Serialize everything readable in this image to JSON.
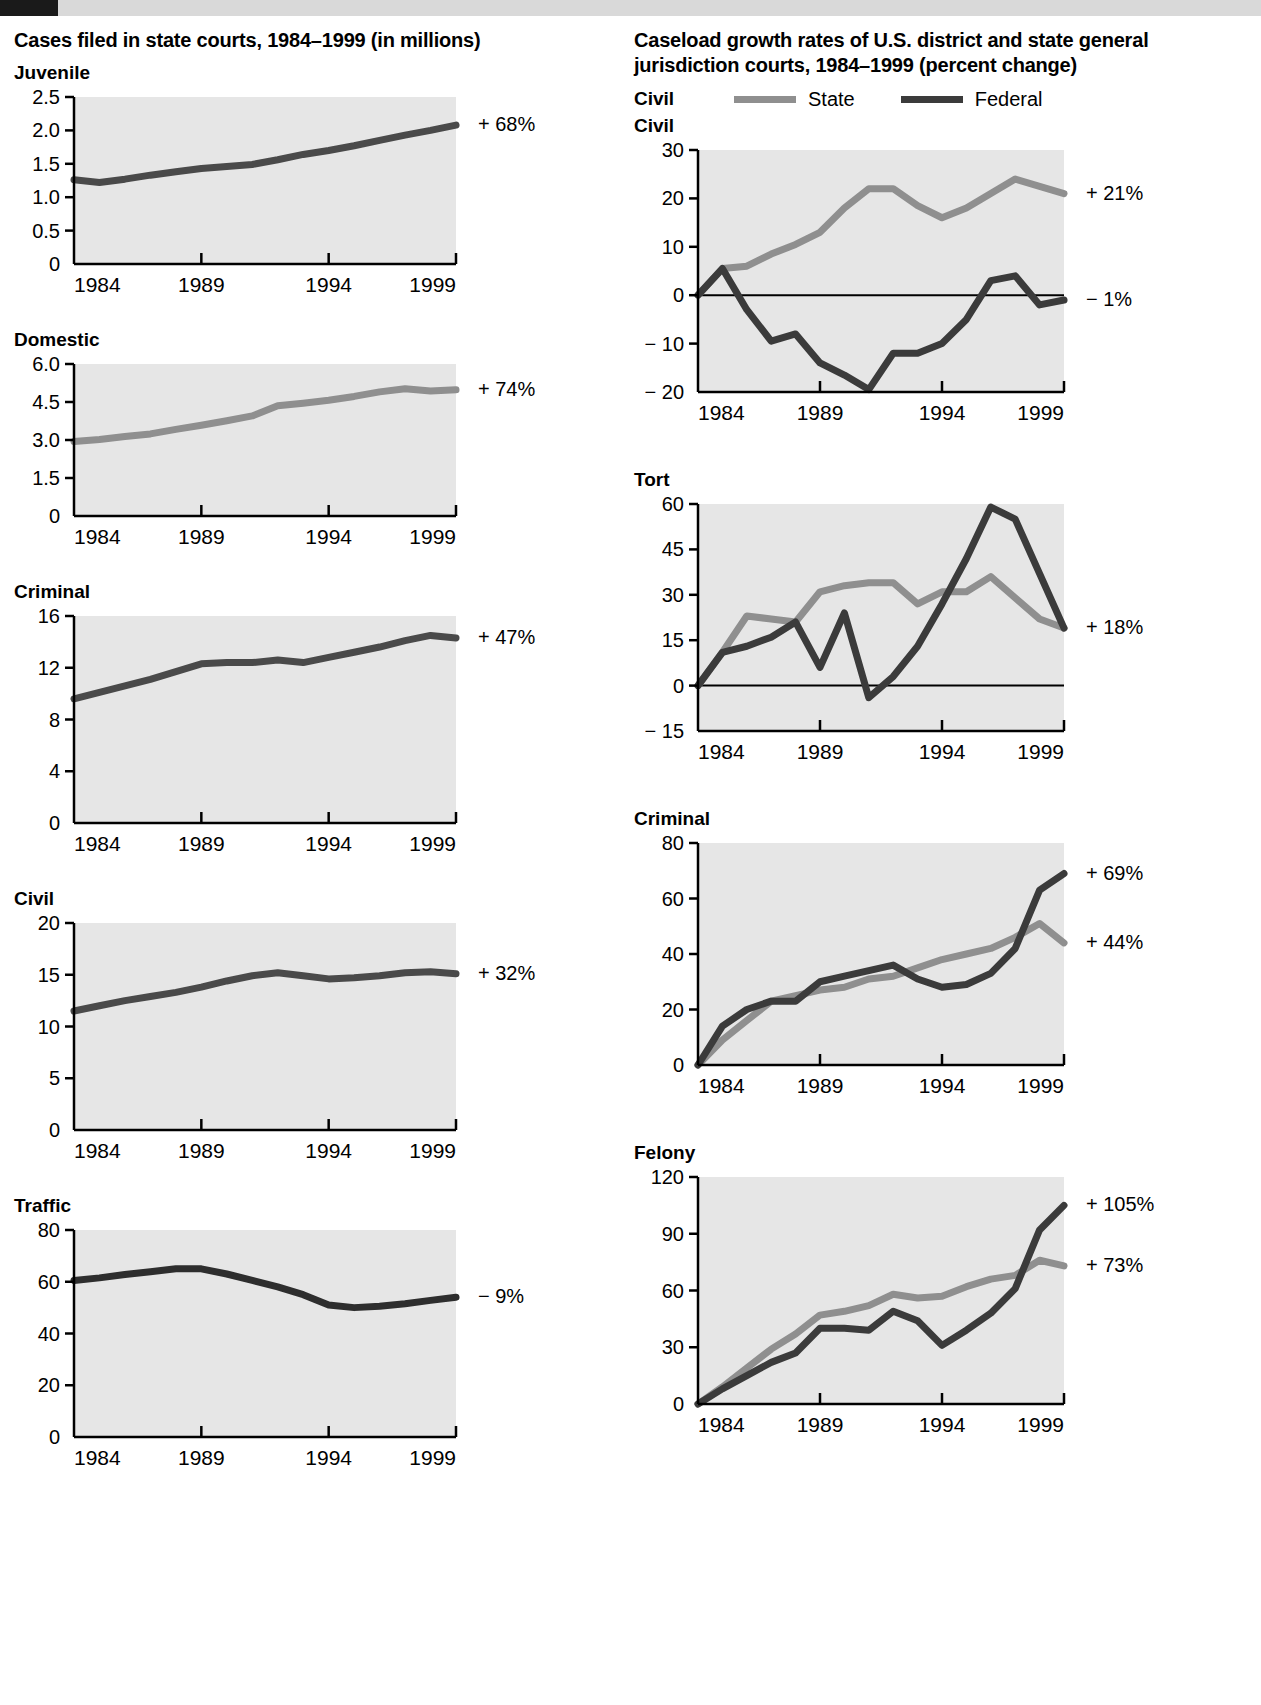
{
  "page": {
    "top_band_color": "#d9d9d9",
    "tab_color": "#1a1a1a"
  },
  "left_column": {
    "title": "Cases filed in state courts, 1984–1999 (in millions)"
  },
  "right_column": {
    "title": "Caseload growth rates of U.S. district and state general jurisdiction courts, 1984–1999 (percent change)",
    "legend": {
      "group_label": "Civil",
      "items": [
        {
          "label": "State",
          "color": "#8f8f8f"
        },
        {
          "label": "Federal",
          "color": "#3b3b3b"
        }
      ]
    }
  },
  "colors": {
    "state_line": "#8f8f8f",
    "federal_line": "#3b3b3b",
    "single_line": "#4a4a4a",
    "plot_bg": "#e6e6e6",
    "axis": "#000000"
  },
  "chart_data": [
    {
      "id": "left-juvenile",
      "type": "line",
      "title": "Juvenile",
      "xlabel": "",
      "ylabel": "",
      "xlim": [
        1984,
        1999
      ],
      "ylim": [
        0,
        2.5
      ],
      "yticks": [
        0,
        0.5,
        1.0,
        1.5,
        2.0,
        2.5
      ],
      "ytick_labels": [
        "0",
        "0.5",
        "1.0",
        "1.5",
        "2.0",
        "2.5"
      ],
      "xticks": [
        1984,
        1989,
        1994,
        1999
      ],
      "xtick_labels": [
        "1984",
        "1989",
        "1994",
        "1999"
      ],
      "grid": false,
      "annotation": "+ 68%",
      "x": [
        1984,
        1985,
        1986,
        1987,
        1988,
        1989,
        1990,
        1991,
        1992,
        1993,
        1994,
        1995,
        1996,
        1997,
        1998,
        1999
      ],
      "series": [
        {
          "name": "State",
          "color": "#4a4a4a",
          "values": [
            1.26,
            1.22,
            1.27,
            1.33,
            1.38,
            1.43,
            1.46,
            1.49,
            1.56,
            1.64,
            1.7,
            1.77,
            1.85,
            1.93,
            2.0,
            2.08
          ]
        }
      ]
    },
    {
      "id": "left-domestic",
      "type": "line",
      "title": "Domestic",
      "xlim": [
        1984,
        1999
      ],
      "ylim": [
        0,
        6.0
      ],
      "yticks": [
        0,
        1.5,
        3.0,
        4.5,
        6.0
      ],
      "ytick_labels": [
        "0",
        "1.5",
        "3.0",
        "4.5",
        "6.0"
      ],
      "xticks": [
        1984,
        1989,
        1994,
        1999
      ],
      "xtick_labels": [
        "1984",
        "1989",
        "1994",
        "1999"
      ],
      "grid": false,
      "annotation": "+ 74%",
      "x": [
        1984,
        1985,
        1986,
        1987,
        1988,
        1989,
        1990,
        1991,
        1992,
        1993,
        1994,
        1995,
        1996,
        1997,
        1998,
        1999
      ],
      "series": [
        {
          "name": "State",
          "color": "#8f8f8f",
          "values": [
            2.94,
            3.02,
            3.14,
            3.24,
            3.42,
            3.58,
            3.76,
            3.95,
            4.35,
            4.45,
            4.57,
            4.72,
            4.9,
            5.02,
            4.93,
            4.98
          ]
        }
      ]
    },
    {
      "id": "left-criminal",
      "type": "line",
      "title": "Criminal",
      "xlim": [
        1984,
        1999
      ],
      "ylim": [
        0,
        16
      ],
      "yticks": [
        0,
        4,
        8,
        12,
        16
      ],
      "ytick_labels": [
        "0",
        "4",
        "8",
        "12",
        "16"
      ],
      "xticks": [
        1984,
        1989,
        1994,
        1999
      ],
      "xtick_labels": [
        "1984",
        "1989",
        "1994",
        "1999"
      ],
      "grid": false,
      "annotation": "+ 47%",
      "x": [
        1984,
        1985,
        1986,
        1987,
        1988,
        1989,
        1990,
        1991,
        1992,
        1993,
        1994,
        1995,
        1996,
        1997,
        1998,
        1999
      ],
      "series": [
        {
          "name": "State",
          "color": "#4a4a4a",
          "values": [
            9.6,
            10.1,
            10.6,
            11.1,
            11.7,
            12.3,
            12.4,
            12.4,
            12.6,
            12.4,
            12.8,
            13.2,
            13.6,
            14.1,
            14.5,
            14.3
          ]
        }
      ]
    },
    {
      "id": "left-civil",
      "type": "line",
      "title": "Civil",
      "xlim": [
        1984,
        1999
      ],
      "ylim": [
        0,
        20
      ],
      "yticks": [
        0,
        5,
        10,
        15,
        20
      ],
      "ytick_labels": [
        "0",
        "5",
        "10",
        "15",
        "20"
      ],
      "xticks": [
        1984,
        1989,
        1994,
        1999
      ],
      "xtick_labels": [
        "1984",
        "1989",
        "1994",
        "1999"
      ],
      "grid": false,
      "annotation": "+ 32%",
      "x": [
        1984,
        1985,
        1986,
        1987,
        1988,
        1989,
        1990,
        1991,
        1992,
        1993,
        1994,
        1995,
        1996,
        1997,
        1998,
        1999
      ],
      "series": [
        {
          "name": "State",
          "color": "#4a4a4a",
          "values": [
            11.5,
            12.0,
            12.5,
            12.9,
            13.3,
            13.8,
            14.4,
            14.9,
            15.2,
            14.9,
            14.6,
            14.7,
            14.9,
            15.2,
            15.3,
            15.1
          ]
        }
      ]
    },
    {
      "id": "left-traffic",
      "type": "line",
      "title": "Traffic",
      "xlim": [
        1984,
        1999
      ],
      "ylim": [
        0,
        80
      ],
      "yticks": [
        0,
        20,
        40,
        60,
        80
      ],
      "ytick_labels": [
        "0",
        "20",
        "40",
        "60",
        "80"
      ],
      "xticks": [
        1984,
        1989,
        1994,
        1999
      ],
      "xtick_labels": [
        "1984",
        "1989",
        "1994",
        "1999"
      ],
      "grid": false,
      "annotation": "− 9%",
      "x": [
        1984,
        1985,
        1986,
        1987,
        1988,
        1989,
        1990,
        1991,
        1992,
        1993,
        1994,
        1995,
        1996,
        1997,
        1998,
        1999
      ],
      "series": [
        {
          "name": "State",
          "color": "#2e2e2e",
          "values": [
            60.5,
            61.5,
            62.8,
            63.9,
            65.0,
            65.0,
            63.0,
            60.5,
            58.0,
            55.0,
            51.0,
            50.0,
            50.5,
            51.5,
            52.8,
            54.0
          ]
        }
      ]
    },
    {
      "id": "right-civil",
      "type": "line",
      "title": "Civil",
      "xlim": [
        1984,
        1999
      ],
      "ylim": [
        -20,
        30
      ],
      "yticks": [
        -20,
        -10,
        0,
        10,
        20,
        30
      ],
      "ytick_labels": [
        "− 20",
        "− 10",
        "0",
        "10",
        "20",
        "30"
      ],
      "xticks": [
        1984,
        1989,
        1994,
        1999
      ],
      "xtick_labels": [
        "1984",
        "1989",
        "1994",
        "1999"
      ],
      "grid": false,
      "zero_line": true,
      "annotations": [
        {
          "text": "+ 21%",
          "value": 21
        },
        {
          "text": "− 1%",
          "value": -1
        }
      ],
      "x": [
        1984,
        1985,
        1986,
        1987,
        1988,
        1989,
        1990,
        1991,
        1992,
        1993,
        1994,
        1995,
        1996,
        1997,
        1998,
        1999
      ],
      "series": [
        {
          "name": "State",
          "color": "#8f8f8f",
          "values": [
            0,
            5.5,
            6.0,
            8.5,
            10.5,
            13.0,
            18.0,
            22.0,
            22.0,
            18.5,
            16.0,
            18.0,
            21.0,
            24.0,
            22.5,
            21.0
          ]
        },
        {
          "name": "Federal",
          "color": "#3b3b3b",
          "values": [
            0,
            5.5,
            -3.0,
            -9.5,
            -8.0,
            -14.0,
            -16.5,
            -19.5,
            -12.0,
            -12.0,
            -10.0,
            -5.0,
            3.0,
            4.0,
            -2.0,
            -1.0
          ]
        }
      ]
    },
    {
      "id": "right-tort",
      "type": "line",
      "title": "Tort",
      "xlim": [
        1984,
        1999
      ],
      "ylim": [
        -15,
        60
      ],
      "yticks": [
        -15,
        0,
        15,
        30,
        45,
        60
      ],
      "ytick_labels": [
        "− 15",
        "0",
        "15",
        "30",
        "45",
        "60"
      ],
      "xticks": [
        1984,
        1989,
        1994,
        1999
      ],
      "xtick_labels": [
        "1984",
        "1989",
        "1994",
        "1999"
      ],
      "grid": false,
      "zero_line": true,
      "annotations": [
        {
          "text": "+ 18%",
          "value": 19
        }
      ],
      "x": [
        1984,
        1985,
        1986,
        1987,
        1988,
        1989,
        1990,
        1991,
        1992,
        1993,
        1994,
        1995,
        1996,
        1997,
        1998,
        1999
      ],
      "series": [
        {
          "name": "State",
          "color": "#8f8f8f",
          "values": [
            0,
            11,
            23,
            22,
            21,
            31,
            33,
            34,
            34,
            27,
            31,
            31,
            36,
            29,
            22,
            19
          ]
        },
        {
          "name": "Federal",
          "color": "#3b3b3b",
          "values": [
            0,
            11,
            13,
            16,
            21,
            6,
            24,
            -4,
            3,
            13,
            27,
            42,
            59,
            55,
            37,
            19
          ]
        }
      ]
    },
    {
      "id": "right-criminal",
      "type": "line",
      "title": "Criminal",
      "xlim": [
        1984,
        1999
      ],
      "ylim": [
        0,
        80
      ],
      "yticks": [
        0,
        20,
        40,
        60,
        80
      ],
      "ytick_labels": [
        "0",
        "20",
        "40",
        "60",
        "80"
      ],
      "xticks": [
        1984,
        1989,
        1994,
        1999
      ],
      "xtick_labels": [
        "1984",
        "1989",
        "1994",
        "1999"
      ],
      "grid": false,
      "annotations": [
        {
          "text": "+ 69%",
          "value": 69
        },
        {
          "text": "+ 44%",
          "value": 44
        }
      ],
      "x": [
        1984,
        1985,
        1986,
        1987,
        1988,
        1989,
        1990,
        1991,
        1992,
        1993,
        1994,
        1995,
        1996,
        1997,
        1998,
        1999
      ],
      "series": [
        {
          "name": "State",
          "color": "#8f8f8f",
          "values": [
            0,
            9,
            16,
            23,
            25,
            27,
            28,
            31,
            32,
            35,
            38,
            40,
            42,
            46,
            51,
            44
          ]
        },
        {
          "name": "Federal",
          "color": "#3b3b3b",
          "values": [
            0,
            14,
            20,
            23,
            23,
            30,
            32,
            34,
            36,
            31,
            28,
            29,
            33,
            42,
            63,
            69
          ]
        }
      ]
    },
    {
      "id": "right-felony",
      "type": "line",
      "title": "Felony",
      "xlim": [
        1984,
        1999
      ],
      "ylim": [
        0,
        120
      ],
      "yticks": [
        0,
        30,
        60,
        90,
        120
      ],
      "ytick_labels": [
        "0",
        "30",
        "60",
        "90",
        "120"
      ],
      "xticks": [
        1984,
        1989,
        1994,
        1999
      ],
      "xtick_labels": [
        "1984",
        "1989",
        "1994",
        "1999"
      ],
      "grid": false,
      "annotations": [
        {
          "text": "+ 105%",
          "value": 105
        },
        {
          "text": "+ 73%",
          "value": 73
        }
      ],
      "x": [
        1984,
        1985,
        1986,
        1987,
        1988,
        1989,
        1990,
        1991,
        1992,
        1993,
        1994,
        1995,
        1996,
        1997,
        1998,
        1999
      ],
      "series": [
        {
          "name": "State",
          "color": "#8f8f8f",
          "values": [
            0,
            9,
            19,
            29,
            37,
            47,
            49,
            52,
            58,
            56,
            57,
            62,
            66,
            68,
            76,
            73
          ]
        },
        {
          "name": "Federal",
          "color": "#3b3b3b",
          "values": [
            0,
            8,
            15,
            22,
            27,
            40,
            40,
            39,
            49,
            44,
            31,
            39,
            48,
            61,
            92,
            105
          ]
        }
      ]
    }
  ]
}
